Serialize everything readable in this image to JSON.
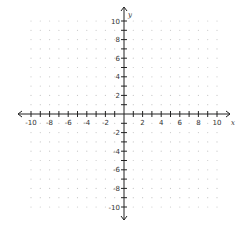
{
  "chart_data": {
    "type": "scatter",
    "title": "",
    "xlabel": "x",
    "ylabel": "y",
    "xlim": [
      -10,
      10
    ],
    "ylim": [
      -10,
      10
    ],
    "grid": "dotted",
    "x_tick_labels": [
      "-10",
      "-8",
      "-6",
      "-4",
      "-2",
      "2",
      "4",
      "6",
      "8",
      "10"
    ],
    "y_tick_labels": [
      "10",
      "8",
      "6",
      "4",
      "2",
      "-2",
      "-4",
      "-6",
      "-8",
      "-10"
    ],
    "series": []
  },
  "layout": {
    "origin_x": 124,
    "origin_y": 114,
    "unit_px": 9.3,
    "axis_color": "#222222",
    "dot_color": "#c8c8c8"
  },
  "labels": {
    "x_axis": "x",
    "y_axis": "y"
  }
}
